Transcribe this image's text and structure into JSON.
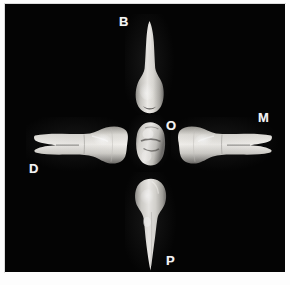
{
  "figure": {
    "background_color": "#fdfdfd",
    "plate_color": "#040404",
    "label_color": "#f4f4f4",
    "enamel_color": "#d8d6d2",
    "shadow_color": "#4a4845"
  },
  "labels": {
    "buccal": "B",
    "distal": "D",
    "occlusal": "O",
    "mesial": "M",
    "palatal": "P"
  },
  "specimens": [
    {
      "view": "buccal",
      "label": "B",
      "description": "tooth-buccal-view"
    },
    {
      "view": "distal",
      "label": "D",
      "description": "tooth-distal-view"
    },
    {
      "view": "occlusal",
      "label": "O",
      "description": "tooth-occlusal-view"
    },
    {
      "view": "mesial",
      "label": "M",
      "description": "tooth-mesial-view"
    },
    {
      "view": "palatal",
      "label": "P",
      "description": "tooth-palatal-view"
    }
  ]
}
